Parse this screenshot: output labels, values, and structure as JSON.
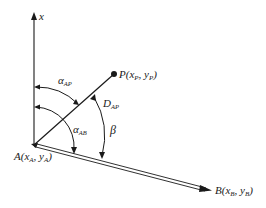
{
  "diagram": {
    "type": "geometry-angle-diagram",
    "axis_label": "x",
    "points": {
      "A": {
        "name": "A",
        "label_main": "A(x",
        "sub1": "A",
        "mid": ", y",
        "sub2": "A",
        "close": ")"
      },
      "P": {
        "name": "P",
        "label_main": "P(x",
        "sub1": "P",
        "mid": ", y",
        "sub2": "P",
        "close": ")"
      },
      "B": {
        "name": "B",
        "label_main": "B(x",
        "sub1": "B",
        "mid": ", y",
        "sub2": "B",
        "close": ")"
      }
    },
    "angles": {
      "alpha_AP": {
        "symbol": "α",
        "sub": "AP"
      },
      "alpha_AB": {
        "symbol": "α",
        "sub": "AB"
      },
      "beta": {
        "symbol": "β"
      }
    },
    "distance": {
      "symbol": "D",
      "sub": "AP"
    },
    "colors": {
      "stroke": "#1a1a1a",
      "background": "#ffffff"
    }
  }
}
